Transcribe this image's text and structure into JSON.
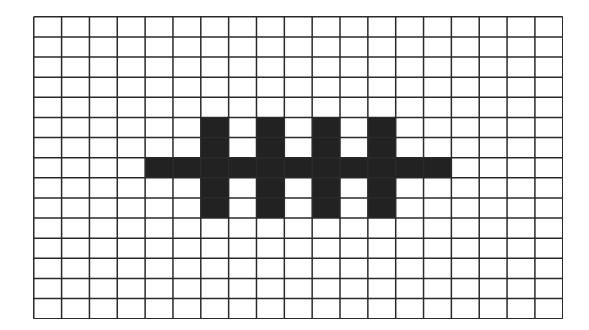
{
  "diagram": {
    "type": "pixel-grid",
    "columns": 19,
    "rows": 15,
    "colors": {
      "filled": "#222222",
      "empty": "#ffffff",
      "grid_line": "#2a2a2a"
    },
    "filled_cells": [
      {
        "row": 7,
        "col": 4
      },
      {
        "row": 7,
        "col": 5
      },
      {
        "row": 7,
        "col": 6
      },
      {
        "row": 7,
        "col": 7
      },
      {
        "row": 7,
        "col": 8
      },
      {
        "row": 7,
        "col": 9
      },
      {
        "row": 7,
        "col": 10
      },
      {
        "row": 7,
        "col": 11
      },
      {
        "row": 7,
        "col": 12
      },
      {
        "row": 7,
        "col": 13
      },
      {
        "row": 7,
        "col": 14
      },
      {
        "row": 5,
        "col": 6
      },
      {
        "row": 6,
        "col": 6
      },
      {
        "row": 8,
        "col": 6
      },
      {
        "row": 9,
        "col": 6
      },
      {
        "row": 5,
        "col": 8
      },
      {
        "row": 6,
        "col": 8
      },
      {
        "row": 8,
        "col": 8
      },
      {
        "row": 9,
        "col": 8
      },
      {
        "row": 5,
        "col": 10
      },
      {
        "row": 6,
        "col": 10
      },
      {
        "row": 8,
        "col": 10
      },
      {
        "row": 9,
        "col": 10
      },
      {
        "row": 5,
        "col": 12
      },
      {
        "row": 6,
        "col": 12
      },
      {
        "row": 8,
        "col": 12
      },
      {
        "row": 9,
        "col": 12
      }
    ]
  }
}
